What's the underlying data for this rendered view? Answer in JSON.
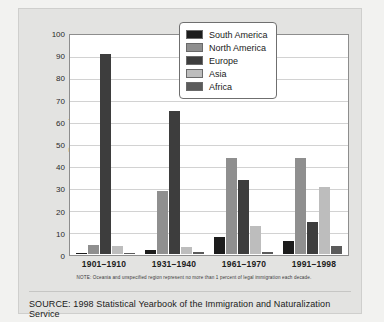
{
  "chart_data": {
    "type": "bar",
    "title": "",
    "xlabel": "",
    "ylabel": "Percentage",
    "ylim": [
      0,
      100
    ],
    "ytick_step": 10,
    "yticks": [
      100,
      90,
      80,
      70,
      60,
      50,
      40,
      30,
      20,
      10,
      0
    ],
    "grid": true,
    "legend_position": "upper right",
    "categories": [
      "1901–1910",
      "1931–1940",
      "1961–1970",
      "1991–1998"
    ],
    "series": [
      {
        "name": "South America",
        "color": "#1c1c1c",
        "values": [
          0.5,
          1.8,
          7.9,
          5.9
        ]
      },
      {
        "name": "North America",
        "color": "#8f8f8f",
        "values": [
          4.2,
          28.8,
          43.9,
          43.9
        ]
      },
      {
        "name": "Europe",
        "color": "#3d3d3d",
        "values": [
          91.6,
          65.8,
          33.8,
          14.9
        ]
      },
      {
        "name": "Asia",
        "color": "#bdbdbd",
        "values": [
          3.9,
          3.4,
          12.8,
          30.9
        ]
      },
      {
        "name": "Africa",
        "color": "#5b5b5b",
        "values": [
          0.2,
          0.7,
          1.0,
          3.9
        ]
      }
    ],
    "note": "NOTE: Oceania and unspecified region represent no more than 1 percent of legal immigration each decade.",
    "source": "SOURCE: 1998 Statistical Yearbook of the Immigration and Naturalization Service"
  }
}
